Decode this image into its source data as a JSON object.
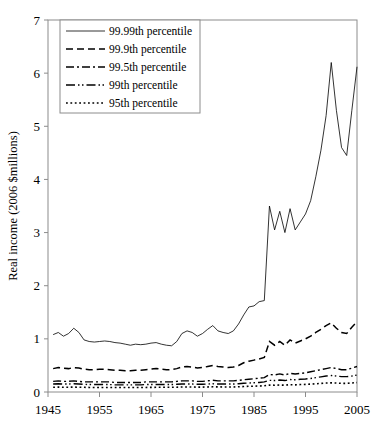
{
  "chart_data": {
    "type": "line",
    "title": "",
    "xlabel": "",
    "ylabel": "Real income (2006 $millions)",
    "xlim": [
      1945,
      2005
    ],
    "ylim": [
      0,
      7
    ],
    "xticks": [
      1945,
      1955,
      1965,
      1975,
      1985,
      1995,
      2005
    ],
    "xtick_labels": [
      "1945",
      "1955",
      "1965",
      "1975",
      "1985",
      "1995",
      "2005"
    ],
    "yticks": [
      0,
      1,
      2,
      3,
      4,
      5,
      6,
      7
    ],
    "ytick_labels": [
      "0",
      "1",
      "2",
      "3",
      "4",
      "5",
      "6",
      "7"
    ],
    "grid": false,
    "legend_position": "upper-left",
    "line_color": "#000000",
    "x": [
      1946,
      1947,
      1948,
      1949,
      1950,
      1951,
      1952,
      1953,
      1954,
      1955,
      1956,
      1957,
      1958,
      1959,
      1960,
      1961,
      1962,
      1963,
      1964,
      1965,
      1966,
      1967,
      1968,
      1969,
      1970,
      1971,
      1972,
      1973,
      1974,
      1975,
      1976,
      1977,
      1978,
      1979,
      1980,
      1981,
      1982,
      1983,
      1984,
      1985,
      1986,
      1987,
      1988,
      1989,
      1990,
      1991,
      1992,
      1993,
      1994,
      1995,
      1996,
      1997,
      1998,
      1999,
      2000,
      2001,
      2002,
      2003,
      2004,
      2005
    ],
    "series": [
      {
        "name": "99.99th percentile",
        "style": "solid",
        "values": [
          1.08,
          1.12,
          1.05,
          1.1,
          1.2,
          1.12,
          0.98,
          0.95,
          0.94,
          0.95,
          0.96,
          0.95,
          0.93,
          0.92,
          0.9,
          0.88,
          0.9,
          0.89,
          0.9,
          0.92,
          0.93,
          0.9,
          0.88,
          0.87,
          0.95,
          1.1,
          1.15,
          1.12,
          1.05,
          1.1,
          1.18,
          1.25,
          1.15,
          1.12,
          1.1,
          1.15,
          1.28,
          1.45,
          1.6,
          1.62,
          1.7,
          1.72,
          3.5,
          3.05,
          3.4,
          3.0,
          3.45,
          3.05,
          3.2,
          3.35,
          3.6,
          4.05,
          4.55,
          5.2,
          6.2,
          5.3,
          4.6,
          4.45,
          5.3,
          6.12
        ]
      },
      {
        "name": "99.9th percentile",
        "style": "dashed",
        "values": [
          0.44,
          0.46,
          0.45,
          0.44,
          0.46,
          0.45,
          0.43,
          0.42,
          0.42,
          0.43,
          0.43,
          0.42,
          0.41,
          0.41,
          0.4,
          0.4,
          0.41,
          0.41,
          0.42,
          0.43,
          0.44,
          0.43,
          0.42,
          0.42,
          0.44,
          0.47,
          0.48,
          0.47,
          0.45,
          0.46,
          0.48,
          0.5,
          0.48,
          0.47,
          0.46,
          0.47,
          0.5,
          0.55,
          0.58,
          0.6,
          0.62,
          0.65,
          0.95,
          0.88,
          0.95,
          0.88,
          0.98,
          0.92,
          0.96,
          1.0,
          1.05,
          1.12,
          1.18,
          1.25,
          1.3,
          1.2,
          1.12,
          1.1,
          1.22,
          1.32
        ]
      },
      {
        "name": "99.5th percentile",
        "style": "dash-dot",
        "values": [
          0.2,
          0.21,
          0.2,
          0.2,
          0.21,
          0.2,
          0.19,
          0.19,
          0.19,
          0.19,
          0.19,
          0.19,
          0.18,
          0.18,
          0.18,
          0.18,
          0.18,
          0.18,
          0.19,
          0.19,
          0.19,
          0.19,
          0.19,
          0.19,
          0.2,
          0.21,
          0.21,
          0.21,
          0.2,
          0.2,
          0.21,
          0.22,
          0.21,
          0.21,
          0.21,
          0.21,
          0.22,
          0.23,
          0.24,
          0.25,
          0.26,
          0.27,
          0.33,
          0.32,
          0.34,
          0.32,
          0.35,
          0.34,
          0.35,
          0.36,
          0.38,
          0.4,
          0.42,
          0.44,
          0.46,
          0.44,
          0.42,
          0.42,
          0.45,
          0.48
        ]
      },
      {
        "name": "99th percentile",
        "style": "dash-dot-dot",
        "values": [
          0.15,
          0.155,
          0.15,
          0.15,
          0.155,
          0.15,
          0.145,
          0.14,
          0.14,
          0.14,
          0.14,
          0.14,
          0.135,
          0.135,
          0.135,
          0.135,
          0.135,
          0.135,
          0.14,
          0.14,
          0.14,
          0.14,
          0.14,
          0.14,
          0.145,
          0.15,
          0.15,
          0.15,
          0.145,
          0.145,
          0.15,
          0.155,
          0.15,
          0.15,
          0.15,
          0.15,
          0.155,
          0.165,
          0.17,
          0.175,
          0.18,
          0.19,
          0.22,
          0.215,
          0.225,
          0.215,
          0.235,
          0.23,
          0.24,
          0.245,
          0.255,
          0.27,
          0.285,
          0.3,
          0.31,
          0.3,
          0.29,
          0.29,
          0.3,
          0.32
        ]
      },
      {
        "name": "95th percentile",
        "style": "dotted",
        "values": [
          0.09,
          0.092,
          0.09,
          0.09,
          0.092,
          0.09,
          0.088,
          0.086,
          0.086,
          0.086,
          0.086,
          0.086,
          0.084,
          0.084,
          0.084,
          0.084,
          0.085,
          0.085,
          0.086,
          0.087,
          0.088,
          0.088,
          0.088,
          0.088,
          0.09,
          0.094,
          0.095,
          0.094,
          0.092,
          0.092,
          0.095,
          0.098,
          0.096,
          0.095,
          0.094,
          0.095,
          0.098,
          0.103,
          0.107,
          0.11,
          0.113,
          0.117,
          0.13,
          0.128,
          0.132,
          0.128,
          0.137,
          0.135,
          0.14,
          0.143,
          0.148,
          0.155,
          0.162,
          0.168,
          0.172,
          0.168,
          0.163,
          0.163,
          0.17,
          0.178
        ]
      }
    ]
  },
  "legend": {
    "items": [
      {
        "label": "99.99th percentile",
        "style": "solid"
      },
      {
        "label": "99.9th percentile",
        "style": "dashed"
      },
      {
        "label": "99.5th percentile",
        "style": "dash-dot"
      },
      {
        "label": "99th percentile",
        "style": "dash-dot-dot"
      },
      {
        "label": "95th percentile",
        "style": "dotted"
      }
    ]
  }
}
